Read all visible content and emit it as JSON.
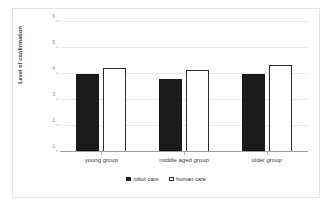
{
  "chart_data": {
    "type": "bar",
    "title": "",
    "xlabel": "",
    "ylabel": "Level of confirmation",
    "categories": [
      "young group",
      "middle aged group",
      "older group"
    ],
    "series": [
      {
        "name": "robot care",
        "values": [
          4.0,
          3.8,
          4.0
        ],
        "color": "#1a1a1a"
      },
      {
        "name": "human care",
        "values": [
          4.25,
          4.15,
          4.35
        ],
        "color": "#ffffff"
      }
    ],
    "ylim": [
      1,
      6
    ],
    "yticks": [
      1,
      2,
      3,
      4,
      5,
      6
    ],
    "ytick_labels": [
      "1",
      "2",
      "3",
      "4",
      "5",
      "6"
    ],
    "grid": true,
    "legend_position": "bottom"
  },
  "legend": {
    "entries": [
      {
        "label": "robot care",
        "swatch": "filled-square-icon"
      },
      {
        "label": "human care",
        "swatch": "outline-square-icon"
      }
    ]
  },
  "axes": {
    "y_title": "Level of confirmation"
  }
}
